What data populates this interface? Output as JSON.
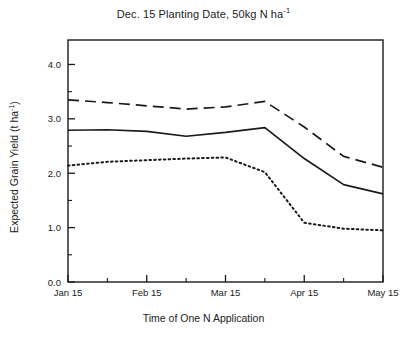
{
  "chart_data": {
    "type": "line",
    "title": "Dec. 15 Planting Date, 50kg N ha-1",
    "title_main": "Dec. 15 Planting Date, 50kg N ha",
    "title_sup": "-1",
    "xlabel": "Time of One N Application",
    "ylabel_main": "Expected Grain Yield (t ha",
    "ylabel_sup": "-1",
    "ylabel_tail": ")",
    "ylabel": "Expected Grain Yield (t ha-1)",
    "x": [
      "Jan 15",
      "Feb 1",
      "Feb 15",
      "Mar 1",
      "Mar 15",
      "Apr 1",
      "Apr 15",
      "May 1",
      "May 15"
    ],
    "categories": [
      "Jan 15",
      "Feb 1",
      "Feb 15",
      "Mar 1",
      "Mar 15",
      "Apr 1",
      "Apr 15",
      "May 1",
      "May 15"
    ],
    "xtick_labels": [
      "Jan 15",
      "Feb 15",
      "Mar 15",
      "Apr 15",
      "May 15"
    ],
    "xtick_minor_count": 4,
    "ytick_labels": [
      "0.0",
      "1.0",
      "2.0",
      "3.0",
      "4.0"
    ],
    "ytick_values": [
      0.0,
      1.0,
      2.0,
      3.0,
      4.0
    ],
    "ytick_minor_values": [
      0.5,
      1.5,
      2.5,
      3.5
    ],
    "ylim": [
      0.0,
      4.45
    ],
    "xlim": [
      0,
      8
    ],
    "grid": false,
    "legend": "none",
    "series": [
      {
        "name": "dashed-series",
        "style": "dashed",
        "color": "#1a1a1a",
        "values": [
          3.35,
          3.3,
          3.24,
          3.18,
          3.22,
          3.32,
          2.85,
          2.31,
          2.11
        ]
      },
      {
        "name": "solid-series",
        "style": "solid",
        "color": "#1a1a1a",
        "values": [
          2.79,
          2.8,
          2.77,
          2.68,
          2.75,
          2.84,
          2.27,
          1.79,
          1.62
        ]
      },
      {
        "name": "dotted-series",
        "style": "dotted",
        "color": "#1a1a1a",
        "values": [
          2.14,
          2.21,
          2.24,
          2.27,
          2.29,
          2.02,
          1.09,
          0.98,
          0.95
        ]
      }
    ]
  },
  "axes": {
    "frame_color": "#1a1a1a"
  }
}
